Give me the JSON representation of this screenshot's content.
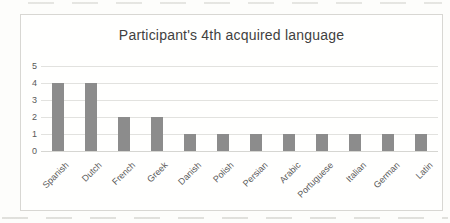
{
  "chart_data": {
    "type": "bar",
    "title": "Participant's 4th acquired language",
    "categories": [
      "Spanish",
      "Dutch",
      "French",
      "Greek",
      "Danish",
      "Polish",
      "Persian",
      "Arabic",
      "Portuguese",
      "Italian",
      "German",
      "Latin"
    ],
    "values": [
      4,
      4,
      2,
      2,
      1,
      1,
      1,
      1,
      1,
      1,
      1,
      1
    ],
    "xlabel": "",
    "ylabel": "",
    "ylim": [
      0,
      5
    ],
    "yticks": [
      5,
      4,
      3,
      2,
      1,
      0
    ],
    "grid": true,
    "legend_position": "none",
    "bar_color": "#8c8c8c",
    "tick_label_color": "#595959",
    "title_color": "#3f3f3f",
    "gridline_color": "#e2e2df",
    "frame_border_color": "#d8d7d3"
  }
}
